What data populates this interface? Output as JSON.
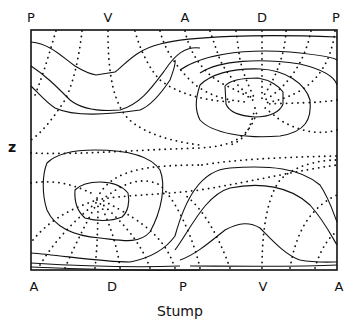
{
  "diagram": {
    "top_labels": [
      "P",
      "V",
      "A",
      "D",
      "P"
    ],
    "bottom_labels": [
      "A",
      "D",
      "P",
      "V",
      "A"
    ],
    "y_label": "z",
    "x_title": "Stump",
    "line_color": "#111111",
    "frame": {
      "x": 30,
      "y": 30,
      "width": 308,
      "height": 240
    }
  }
}
